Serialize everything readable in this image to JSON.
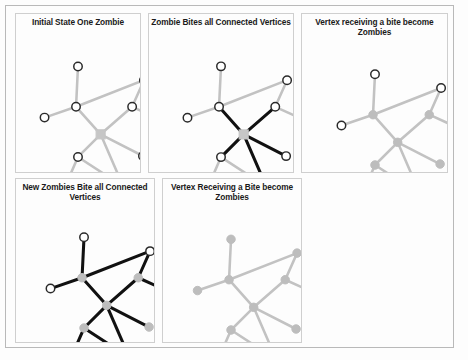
{
  "figure": {
    "background_color": "#fdfdfd",
    "frame_color": "#b9b9b9",
    "edge_gray_color": "#c2c2c2",
    "edge_black_color": "#111111",
    "node_white_fill": "#ffffff",
    "node_zombie_fill": "#c6c6c6",
    "node_stroke_color": "#2a2a2a"
  },
  "panels": [
    {
      "id": "panel-initial-state",
      "title": "Initial State One Zombie",
      "description": "One square zombie vertex at the graph hub; all other vertices are white circles and all edges are gray."
    },
    {
      "id": "panel-zombie-bites",
      "title": "Zombie Bites all Connected Vertices",
      "description": "Edges from the zombie vertex to its five neighbors are drawn black to show bites."
    },
    {
      "id": "panel-bitten-become-zombies",
      "title": "Vertex receiving a bite become Zombies",
      "description": "The five bitten neighbors are now filled gray as zombies; edges return to gray."
    },
    {
      "id": "panel-new-zombies-bite",
      "title": "New Zombies Bite all Connected Vertices",
      "description": "All edges are black as the new zombies bite every remaining connected vertex."
    },
    {
      "id": "panel-all-become-zombies",
      "title": "Vertex Receiving a Bite become Zombies",
      "description": "Every vertex in the graph is now a gray zombie and all edges are gray."
    }
  ],
  "graph": {
    "nodes": [
      {
        "id": "top",
        "x": 63,
        "y": 31
      },
      {
        "id": "hub_left",
        "x": 61,
        "y": 72
      },
      {
        "id": "far_left",
        "x": 29,
        "y": 83
      },
      {
        "id": "top_right",
        "x": 130,
        "y": 45
      },
      {
        "id": "upper_right",
        "x": 118,
        "y": 72
      },
      {
        "id": "far_right",
        "x": 151,
        "y": 87
      },
      {
        "id": "center",
        "x": 86,
        "y": 100
      },
      {
        "id": "lower_left",
        "x": 63,
        "y": 123
      },
      {
        "id": "lower_right",
        "x": 129,
        "y": 122
      },
      {
        "id": "bottom",
        "x": 109,
        "y": 153
      },
      {
        "id": "bottom_left",
        "x": 46,
        "y": 162
      }
    ],
    "edges": [
      {
        "from": "top",
        "to": "hub_left"
      },
      {
        "from": "far_left",
        "to": "hub_left"
      },
      {
        "from": "hub_left",
        "to": "top_right"
      },
      {
        "from": "hub_left",
        "to": "center"
      },
      {
        "from": "top_right",
        "to": "upper_right"
      },
      {
        "from": "upper_right",
        "to": "far_right"
      },
      {
        "from": "upper_right",
        "to": "center"
      },
      {
        "from": "center",
        "to": "lower_left"
      },
      {
        "from": "center",
        "to": "lower_right"
      },
      {
        "from": "center",
        "to": "bottom"
      },
      {
        "from": "lower_left",
        "to": "bottom_left"
      },
      {
        "from": "lower_left",
        "to": "bottom"
      }
    ],
    "zombie_sets": {
      "stage1": [
        "center"
      ],
      "stage2": [
        "center",
        "hub_left",
        "upper_right",
        "lower_left",
        "lower_right",
        "bottom"
      ],
      "stage3": [
        "top",
        "hub_left",
        "far_left",
        "top_right",
        "upper_right",
        "far_right",
        "center",
        "lower_left",
        "lower_right",
        "bottom",
        "bottom_left"
      ]
    },
    "black_edge_sets": {
      "stage_bite1": [
        {
          "from": "hub_left",
          "to": "center"
        },
        {
          "from": "upper_right",
          "to": "center"
        },
        {
          "from": "center",
          "to": "lower_left"
        },
        {
          "from": "center",
          "to": "lower_right"
        },
        {
          "from": "center",
          "to": "bottom"
        }
      ],
      "stage_bite2": [
        {
          "from": "top",
          "to": "hub_left"
        },
        {
          "from": "far_left",
          "to": "hub_left"
        },
        {
          "from": "hub_left",
          "to": "top_right"
        },
        {
          "from": "hub_left",
          "to": "center"
        },
        {
          "from": "top_right",
          "to": "upper_right"
        },
        {
          "from": "upper_right",
          "to": "far_right"
        },
        {
          "from": "upper_right",
          "to": "center"
        },
        {
          "from": "center",
          "to": "lower_left"
        },
        {
          "from": "center",
          "to": "lower_right"
        },
        {
          "from": "center",
          "to": "bottom"
        },
        {
          "from": "lower_left",
          "to": "bottom_left"
        },
        {
          "from": "lower_left",
          "to": "bottom"
        }
      ]
    }
  }
}
